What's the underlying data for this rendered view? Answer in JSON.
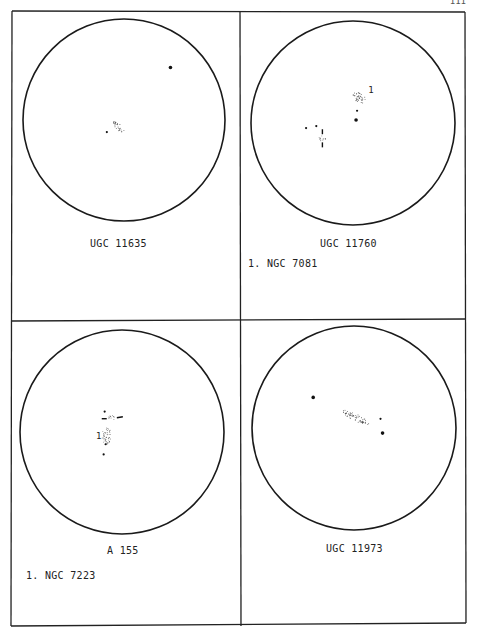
{
  "page": {
    "page_number": "111"
  },
  "panels": [
    {
      "id": "ugc-11635",
      "title": "UGC 11635",
      "notes": [],
      "objects": [
        {
          "type": "galaxy",
          "x": -0.06,
          "y": 0.06,
          "rx": 0.08,
          "ry": 0.03,
          "angle": 45
        },
        {
          "type": "star",
          "x": -0.17,
          "y": 0.12,
          "size": "small"
        },
        {
          "type": "star",
          "x": 0.46,
          "y": -0.52,
          "size": "medium"
        }
      ]
    },
    {
      "id": "ugc-11760",
      "title": "UGC 11760",
      "notes": [
        "1. NGC 7081"
      ],
      "objects": [
        {
          "type": "galaxy",
          "x": 0.06,
          "y": -0.25,
          "rx": 0.07,
          "ry": 0.045,
          "angle": 35,
          "label": "1"
        },
        {
          "type": "star",
          "x": 0.04,
          "y": -0.12,
          "size": "small"
        },
        {
          "type": "star",
          "x": 0.03,
          "y": -0.03,
          "size": "medium"
        },
        {
          "type": "star",
          "x": -0.46,
          "y": 0.05,
          "size": "small"
        },
        {
          "type": "star",
          "x": -0.36,
          "y": 0.03,
          "size": "small"
        },
        {
          "type": "galaxy",
          "x": -0.3,
          "y": 0.15,
          "rx": 0.035,
          "ry": 0.03,
          "angle": 0,
          "ticks": "vertical"
        }
      ]
    },
    {
      "id": "a-155",
      "title": "A 155",
      "notes": [
        "1. NGC 7223"
      ],
      "objects": [
        {
          "type": "star",
          "x": -0.17,
          "y": -0.2,
          "size": "small"
        },
        {
          "type": "galaxy",
          "x": -0.1,
          "y": -0.14,
          "rx": 0.03,
          "ry": 0.025,
          "angle": 0,
          "ticks": "horizontal"
        },
        {
          "type": "galaxy",
          "x": -0.15,
          "y": 0.04,
          "rx": 0.045,
          "ry": 0.09,
          "angle": 0,
          "label": "1"
        },
        {
          "type": "star",
          "x": -0.16,
          "y": 0.12,
          "size": "small"
        },
        {
          "type": "star",
          "x": -0.18,
          "y": 0.22,
          "size": "small"
        }
      ]
    },
    {
      "id": "ugc-11973",
      "title": "UGC 11973",
      "notes": [],
      "objects": [
        {
          "type": "galaxy",
          "x": 0.02,
          "y": -0.1,
          "rx": 0.15,
          "ry": 0.035,
          "angle": 28
        },
        {
          "type": "star",
          "x": -0.4,
          "y": -0.3,
          "size": "medium"
        },
        {
          "type": "star",
          "x": 0.26,
          "y": -0.09,
          "size": "small"
        },
        {
          "type": "star",
          "x": 0.28,
          "y": 0.05,
          "size": "medium"
        }
      ]
    }
  ]
}
